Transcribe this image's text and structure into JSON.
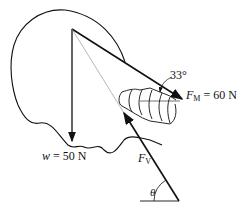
{
  "figure": {
    "labels": {
      "angle_33": "33°",
      "fm_symbol": "F",
      "fm_sub": "M",
      "fm_value": "= 60 N",
      "w_symbol": "w",
      "w_value": "= 50 N",
      "fv_symbol": "F",
      "fv_sub": "V",
      "theta": "θ"
    },
    "forces": [
      {
        "name": "F_M",
        "magnitude": "60 N",
        "angle_deg": 33
      },
      {
        "name": "w",
        "magnitude": "50 N",
        "direction": "down"
      },
      {
        "name": "F_V",
        "angle": "θ"
      }
    ],
    "colors": {
      "line": "#111111",
      "thin_line": "#888888"
    }
  }
}
